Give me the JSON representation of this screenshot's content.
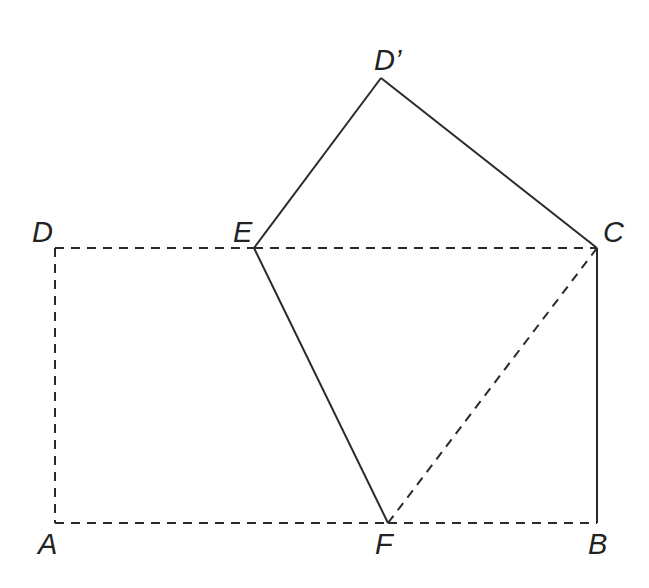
{
  "diagram": {
    "type": "geometry-fold",
    "points": {
      "A": {
        "label": "A",
        "x": 55,
        "y": 523
      },
      "B": {
        "label": "B",
        "x": 597,
        "y": 523
      },
      "C": {
        "label": "C",
        "x": 597,
        "y": 248
      },
      "D": {
        "label": "D",
        "x": 55,
        "y": 248
      },
      "E": {
        "label": "E",
        "x": 254,
        "y": 248
      },
      "F": {
        "label": "F",
        "x": 388,
        "y": 523
      },
      "D_prime": {
        "label": "D’",
        "x": 381,
        "y": 78
      }
    },
    "segments": {
      "solid": [
        "E-D'",
        "D'-C",
        "E-F",
        "C-B"
      ],
      "dashed": [
        "D-E",
        "E-C",
        "D-A",
        "A-F",
        "F-B",
        "F-C"
      ]
    },
    "colors": {
      "line": "#2a2a2a",
      "label": "#222222",
      "background": "#ffffff"
    }
  }
}
